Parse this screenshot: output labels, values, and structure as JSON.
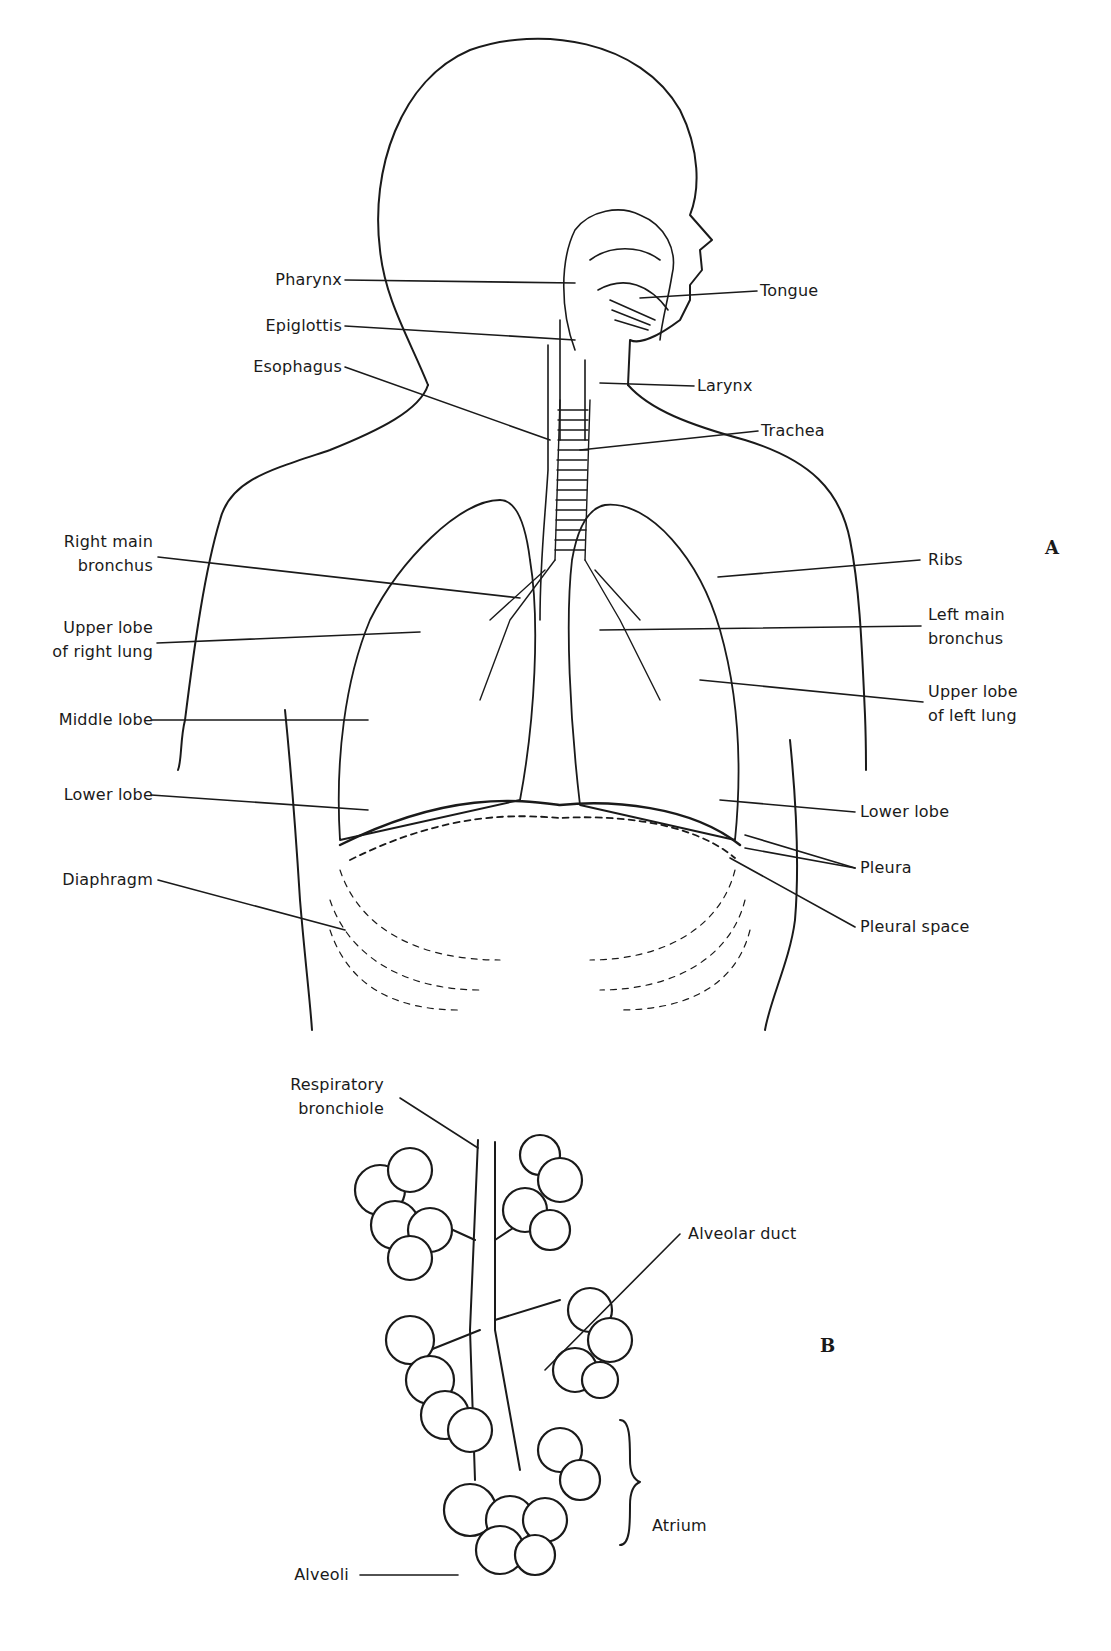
{
  "figure": {
    "panel_a": {
      "marker": "A",
      "labels": {
        "pharynx": "Pharynx",
        "epiglottis": "Epiglottis",
        "esophagus": "Esophagus",
        "tongue": "Tongue",
        "larynx": "Larynx",
        "trachea": "Trachea",
        "right_main_bronchus_1": "Right main",
        "right_main_bronchus_2": "bronchus",
        "upper_lobe_right_1": "Upper lobe",
        "upper_lobe_right_2": "of right lung",
        "middle_lobe": "Middle lobe",
        "lower_lobe_right": "Lower lobe",
        "diaphragm": "Diaphragm",
        "ribs": "Ribs",
        "left_main_bronchus_1": "Left main",
        "left_main_bronchus_2": "bronchus",
        "upper_lobe_left_1": "Upper lobe",
        "upper_lobe_left_2": "of left lung",
        "lower_lobe_left": "Lower lobe",
        "pleura": "Pleura",
        "pleural_space": "Pleural space"
      }
    },
    "panel_b": {
      "marker": "B",
      "labels": {
        "respiratory_bronchiole_1": "Respiratory",
        "respiratory_bronchiole_2": "bronchiole",
        "alveolar_duct": "Alveolar duct",
        "atrium": "Atrium",
        "alveoli": "Alveoli"
      }
    }
  }
}
